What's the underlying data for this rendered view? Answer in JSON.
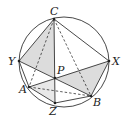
{
  "diagram": {
    "type": "geometry",
    "circle": {
      "cx": 64,
      "cy": 62,
      "r": 45
    },
    "points": {
      "C": {
        "x": 54,
        "y": 19,
        "label": "C"
      },
      "Y": {
        "x": 19,
        "y": 61,
        "label": "Y"
      },
      "X": {
        "x": 109,
        "y": 61,
        "label": "X"
      },
      "P": {
        "x": 55,
        "y": 78,
        "label": "P"
      },
      "A": {
        "x": 29,
        "y": 87,
        "label": "A"
      },
      "B": {
        "x": 91,
        "y": 96,
        "label": "B"
      },
      "Z": {
        "x": 55,
        "y": 103,
        "label": "Z"
      }
    },
    "labels": {
      "C": "C",
      "Y": "Y",
      "X": "X",
      "P": "P",
      "A": "A",
      "B": "B",
      "Z": "Z"
    },
    "shading_color": "#dcdcdc",
    "line_color": "#333333"
  }
}
